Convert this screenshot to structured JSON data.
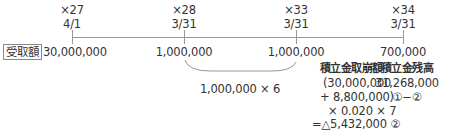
{
  "timeline": {
    "points": [
      {
        "year": "×27",
        "date": "4/1",
        "amount": "30,000,000"
      },
      {
        "year": "×28",
        "date": "3/31",
        "amount": "1,000,000"
      },
      {
        "year": "×33",
        "date": "3/31",
        "amount": "1,000,000"
      },
      {
        "year": "×34",
        "date": "3/31",
        "amount": "700,000"
      }
    ],
    "row_label": "受取額"
  },
  "brace_note": "1,000,000 × 6",
  "withdrawal": {
    "title": "積立金取崩額",
    "lines": [
      "(30,000,000",
      "+ 8,800,000)",
      "× 0.020 × 7",
      "=△5,432,000 ②"
    ]
  },
  "balance": {
    "title": "積立金残高",
    "value": "31,268,000",
    "formula": "①−②"
  },
  "colors": {
    "line": "#999999",
    "text": "#333333"
  }
}
